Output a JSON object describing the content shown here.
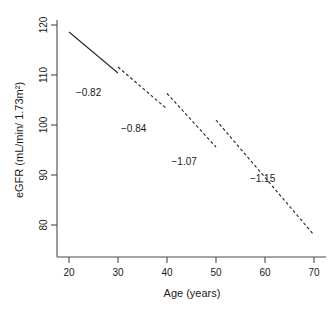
{
  "chart_data": {
    "type": "line",
    "title": "",
    "xlabel": "Age (years)",
    "ylabel": "eGFR (mL/min/ 1.73m2)",
    "ylabel_display": "eGFR (mL/min/ 1.73m²)",
    "xlim": [
      18,
      72
    ],
    "ylim": [
      74,
      122
    ],
    "xticks": [
      20,
      30,
      40,
      50,
      60,
      70
    ],
    "xtick_labels": [
      "20",
      "30",
      "40",
      "50",
      "60",
      "70"
    ],
    "yticks": [
      80,
      90,
      100,
      110,
      120
    ],
    "ytick_labels": [
      "80",
      "90",
      "100",
      "110",
      "120"
    ],
    "grid": false,
    "legend": "none",
    "series": [
      {
        "name": "age 20-30 segment",
        "slope": -0.82,
        "slope_label": "−0.82",
        "style": "solid",
        "x": [
          20,
          30
        ],
        "y": [
          118.6,
          110.4
        ]
      },
      {
        "name": "age 30-40 segment",
        "slope": -0.84,
        "slope_label": "−0.84",
        "style": "dashed",
        "x": [
          30,
          40
        ],
        "y": [
          111.6,
          103.2
        ]
      },
      {
        "name": "age 40-50 segment",
        "slope": -1.07,
        "slope_label": "−1.07",
        "style": "dashed",
        "x": [
          40,
          50
        ],
        "y": [
          106.3,
          95.6
        ]
      },
      {
        "name": "age 50-70 segment",
        "slope": -1.15,
        "slope_label": "−1.15",
        "style": "dashed",
        "x": [
          50,
          70
        ],
        "y": [
          101.0,
          78.0
        ]
      }
    ],
    "annotations": [
      {
        "text": "−0.82",
        "x": 24.0,
        "y": 105.8
      },
      {
        "text": "−0.84",
        "x": 33.2,
        "y": 98.6
      },
      {
        "text": "−1.07",
        "x": 43.5,
        "y": 92.0
      },
      {
        "text": "−1.15",
        "x": 59.5,
        "y": 88.7
      }
    ]
  }
}
